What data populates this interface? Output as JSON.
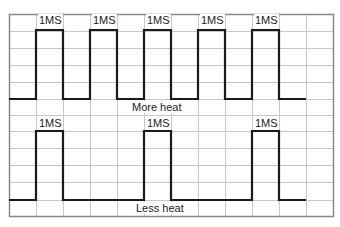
{
  "diagram": {
    "grid": {
      "left": 9,
      "top": 14,
      "right": 333,
      "bottom": 216,
      "col_width": 27,
      "rows": [
        14,
        31,
        48,
        65,
        82,
        99,
        115,
        131,
        148,
        165,
        182,
        200,
        216
      ],
      "color": "#c8c8c8",
      "border_color": "#888888"
    },
    "pulse_width_label": "1MS",
    "waveforms": [
      {
        "name": "more-heat",
        "caption": "More heat",
        "high_y": 30,
        "low_y": 99,
        "start_x": 9,
        "end_x": 306,
        "pulses": [
          [
            36,
            63
          ],
          [
            90,
            117
          ],
          [
            144,
            171
          ],
          [
            198,
            225
          ],
          [
            252,
            279
          ]
        ],
        "caption_x": 143,
        "caption_y": 100
      },
      {
        "name": "less-heat",
        "caption": "Less heat",
        "high_y": 131,
        "low_y": 200,
        "start_x": 9,
        "end_x": 306,
        "pulses": [
          [
            36,
            63
          ],
          [
            144,
            171
          ],
          [
            252,
            279
          ]
        ],
        "caption_x": 137,
        "caption_y": 202
      }
    ],
    "labels": {
      "top": [
        "1MS",
        "1MS",
        "1MS",
        "1MS",
        "1MS"
      ],
      "bottom": [
        "1MS",
        "1MS",
        "1MS"
      ],
      "more_heat": "More heat",
      "less_heat": "Less heat"
    }
  }
}
